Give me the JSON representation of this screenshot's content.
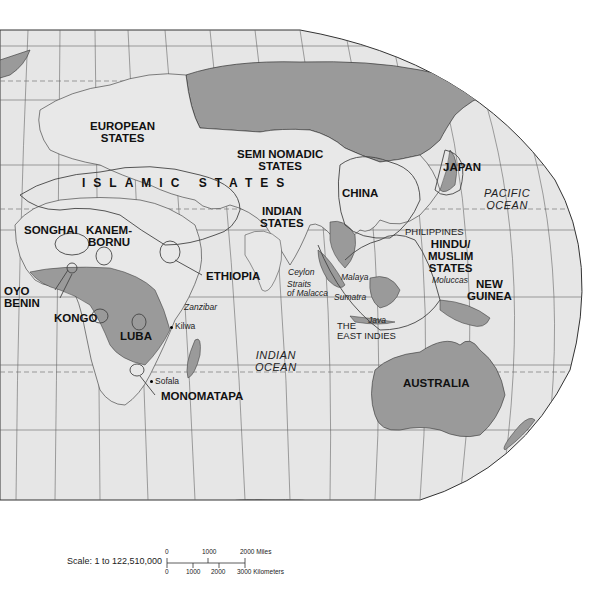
{
  "map": {
    "colors": {
      "land": "#e8e8e8",
      "ocean": "#e6e6e6",
      "highlight": "#9a9a9a",
      "coast": "#333333",
      "grid": "#555555",
      "border": "#444444",
      "outside": "#ffffff"
    },
    "states": {
      "european": [
        "EUROPEAN",
        "STATES"
      ],
      "islamic": "ISLAMIC STATES",
      "semi_nomadic": [
        "SEMI NOMADIC",
        "STATES"
      ],
      "china": "CHINA",
      "japan": "JAPAN",
      "indian": [
        "INDIAN",
        "STATES"
      ],
      "songhai": "SONGHAI",
      "kanem_bornu": [
        "KANEM-",
        "BORNU"
      ],
      "ethiopia": "ETHIOPIA",
      "oyo_benin": [
        "OYO",
        "BENIN"
      ],
      "kongo": "KONGO",
      "luba": "LUBA",
      "monomatapa": "MONOMATAPA",
      "hindu_muslim": [
        "HINDU/",
        "MUSLIM",
        "STATES"
      ],
      "new_guinea": [
        "NEW",
        "GUINEA"
      ],
      "australia": "AUSTRALIA"
    },
    "oceans": {
      "pacific": [
        "PACIFIC",
        "OCEAN"
      ],
      "indian": [
        "INDIAN",
        "OCEAN"
      ]
    },
    "places": {
      "zanzibar": "Zanzibar",
      "kilwa": "Kilwa",
      "sofala": "Sofala",
      "ceylon": "Ceylon",
      "straits": [
        "Straits",
        "of Malacca"
      ],
      "malaya": "Malaya",
      "sumatra": "Sumatra",
      "java": "Java",
      "moluccas": "Moluccas"
    },
    "regions": {
      "philippines": "PHILIPPINES",
      "east_indies": [
        "THE",
        "EAST INDIES"
      ]
    },
    "scale": {
      "label": "Scale:  1 to 122,510,000",
      "miles_ticks": [
        "0",
        "1000",
        "2000 Miles"
      ],
      "km_ticks": [
        "0",
        "1000",
        "2000",
        "3000 Kilometers"
      ]
    }
  }
}
